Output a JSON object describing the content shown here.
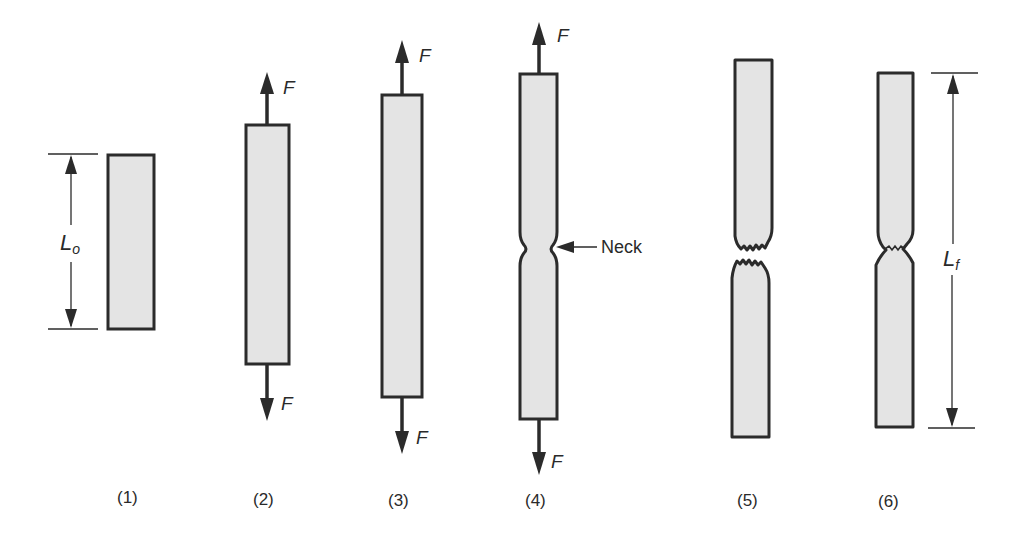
{
  "figure": {
    "colors": {
      "specimen_fill": "#e4e4e4",
      "outline": "#2b2b2b",
      "text": "#2a2a2a",
      "background": "#ffffff"
    },
    "stages": [
      {
        "id": 1,
        "label": "(1)",
        "description": "Original specimen, gauge length L_o"
      },
      {
        "id": 2,
        "label": "(2)",
        "description": "Uniform elongation under load F"
      },
      {
        "id": 3,
        "label": "(3)",
        "description": "Continued uniform elongation"
      },
      {
        "id": 4,
        "label": "(4)",
        "description": "Necking begins"
      },
      {
        "id": 5,
        "label": "(5)",
        "description": "Fracture"
      },
      {
        "id": 6,
        "label": "(6)",
        "description": "Pieces fitted together, final length L_f"
      }
    ],
    "force_label": "F",
    "neck_label": "Neck",
    "original_length": {
      "symbol": "L",
      "subscript": "o"
    },
    "final_length": {
      "symbol": "L",
      "subscript": "f"
    }
  }
}
